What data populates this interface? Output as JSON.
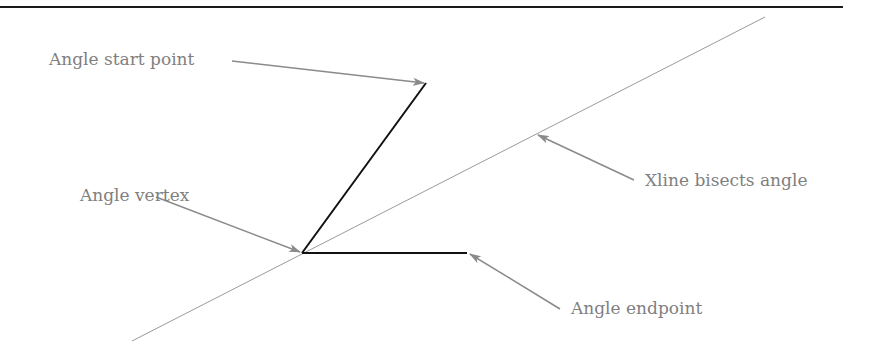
{
  "diagram": {
    "colors": {
      "rule": "#1a1a1a",
      "angle_lines": "#111111",
      "xline": "#9a9a9a",
      "callout": "#8a8a8a",
      "label_text": "#808080"
    },
    "labels": {
      "start_point": "Angle start point",
      "vertex": "Angle vertex",
      "bisects": "Xline bisects angle",
      "endpoint": "Angle endpoint"
    },
    "points": {
      "vertex": [
        302,
        253
      ],
      "start_point": [
        426,
        83
      ],
      "endpoint": [
        467,
        253
      ],
      "xline_start": [
        132,
        341
      ],
      "xline_end": [
        765,
        17
      ]
    }
  }
}
